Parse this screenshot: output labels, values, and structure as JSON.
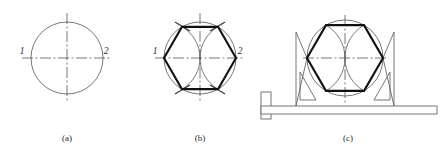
{
  "figure": {
    "background_color": "#ffffff",
    "line_color_thin": "#555555",
    "line_color_heavy": "#111111",
    "tool_color": "#666666",
    "width": 443,
    "height": 152
  },
  "panels": [
    {
      "id": "a",
      "caption": "(a)",
      "caption_x": 67,
      "caption_y": 141,
      "description": "Circle with horizontal and vertical dash-dot centrelines; ends of the horizontal diameter labelled 1 and 2",
      "circle": {
        "cx": 67,
        "cy": 58,
        "r": 36
      },
      "centerline_overhang": 9,
      "point_labels": [
        {
          "text": "1",
          "x": 22,
          "y": 54
        },
        {
          "text": "2",
          "x": 106,
          "y": 54
        }
      ]
    },
    {
      "id": "b",
      "caption": "(b)",
      "caption_x": 200,
      "caption_y": 141,
      "description": "Two arcs of radius R struck from points 1 and 2 cut the circle at four points; joining these with 1 and 2 gives the hexagon",
      "circle": {
        "cx": 200,
        "cy": 58,
        "r": 36
      },
      "centerline_overhang": 9,
      "arcs": [
        {
          "center_label": "1",
          "cx": 164,
          "cy": 58,
          "r": 36
        },
        {
          "center_label": "2",
          "cx": 236,
          "cy": 58,
          "r": 36
        }
      ],
      "hexagon_vertices": [
        {
          "x": 236,
          "y": 58
        },
        {
          "x": 218,
          "y": 26.83
        },
        {
          "x": 182,
          "y": 26.83
        },
        {
          "x": 164,
          "y": 58
        },
        {
          "x": 182,
          "y": 89.17
        },
        {
          "x": 218,
          "y": 89.17
        }
      ],
      "point_labels": [
        {
          "text": "1",
          "x": 155,
          "y": 54
        },
        {
          "text": "2",
          "x": 239,
          "y": 54
        }
      ],
      "tick_marks_at_vertices": 4
    },
    {
      "id": "c",
      "caption": "(c)",
      "caption_x": 348,
      "caption_y": 141,
      "description": "The same hexagon drawn with a T-square and two 30-60 set squares resting on the blade",
      "circle": {
        "cx": 345,
        "cy": 58,
        "r": 38
      },
      "centerline_overhang": 9,
      "hexagon_vertices": [
        {
          "x": 383,
          "y": 58
        },
        {
          "x": 364,
          "y": 25.1
        },
        {
          "x": 326,
          "y": 25.1
        },
        {
          "x": 307,
          "y": 58
        },
        {
          "x": 326,
          "y": 90.9
        },
        {
          "x": 364,
          "y": 90.9
        }
      ],
      "tools": {
        "tsquare_head": {
          "x": 261,
          "y": 92,
          "w": 10,
          "h": 27
        },
        "tsquare_blade": {
          "x": 261,
          "y": 106,
          "w": 176,
          "h": 8
        },
        "left_set_square": "right triangle, vertical edge at left, hypotenuse rising to the right",
        "right_set_square": "right triangle, vertical edge at right, hypotenuse rising to the left"
      }
    }
  ]
}
